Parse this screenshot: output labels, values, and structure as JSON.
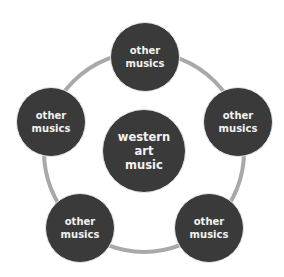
{
  "diagram": {
    "center": {
      "label": "western\nart\nmusic"
    },
    "satellites": [
      {
        "position": "top",
        "label": "other\nmusics"
      },
      {
        "position": "right",
        "label": "other\nmusics"
      },
      {
        "position": "bottom-right",
        "label": "other\nmusics"
      },
      {
        "position": "bottom-left",
        "label": "other\nmusics"
      },
      {
        "position": "left",
        "label": "other\nmusics"
      }
    ],
    "colors": {
      "node_fill": "#3a3a3a",
      "node_text": "#f2f2f2",
      "ring": "#a9a9a9",
      "background": "#ffffff"
    }
  }
}
